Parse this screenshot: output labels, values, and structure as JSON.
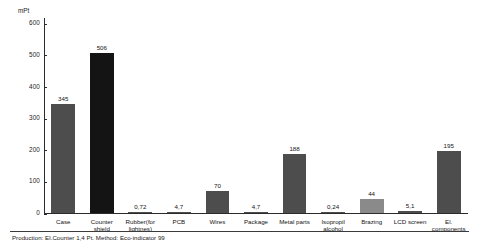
{
  "chart_data": {
    "type": "bar",
    "title": "",
    "subtitle": "",
    "xlabel": "",
    "ylabel": "mPt",
    "ylim": [
      0,
      620
    ],
    "grid": false,
    "legend": "none",
    "yticks": [
      0,
      100,
      200,
      300,
      400,
      500,
      600
    ],
    "ytick_labels": [
      "0",
      "100",
      "200",
      "300",
      "400",
      "500",
      "600"
    ],
    "categories": [
      "Case",
      "Counter shield",
      "Rubber(for lightnes)",
      "PCB",
      "Wires",
      "Package",
      "Metal parts",
      "Isopropil alcohol",
      "Brazing",
      "LCD screen",
      "El. components"
    ],
    "category_lines": [
      [
        "Case"
      ],
      [
        "Counter",
        "shield"
      ],
      [
        "Rubber(for",
        "lightnes)"
      ],
      [
        "PCB"
      ],
      [
        "Wires"
      ],
      [
        "Package"
      ],
      [
        "Metal parts"
      ],
      [
        "Isopropil",
        "alcohol"
      ],
      [
        "Brazing"
      ],
      [
        "LCD screen"
      ],
      [
        "El.",
        "components"
      ]
    ],
    "values": [
      345,
      506,
      0.72,
      4.7,
      70,
      4.7,
      188,
      0.24,
      44,
      5.1,
      195
    ],
    "value_labels": [
      "345",
      "506",
      "0,72",
      "4,7",
      "70",
      "4,7",
      "188",
      "0,24",
      "44",
      "5,1",
      "195"
    ],
    "bar_colors": [
      "#4d4d4d",
      "#141414",
      "#4d4d4d",
      "#4d4d4d",
      "#4d4d4d",
      "#4d4d4d",
      "#4d4d4d",
      "#4d4d4d",
      "#8a8a8a",
      "#4d4d4d",
      "#4d4d4d"
    ],
    "caption": "Production: El.Counter 1,4 Pt. Method: Eco-indicator 99"
  },
  "colors": {
    "axis": "#2b2b2b",
    "text": "#141414",
    "background": "#ffffff",
    "bar_default": "#4d4d4d",
    "bar_highlight": "#141414",
    "bar_light": "#8a8a8a"
  }
}
